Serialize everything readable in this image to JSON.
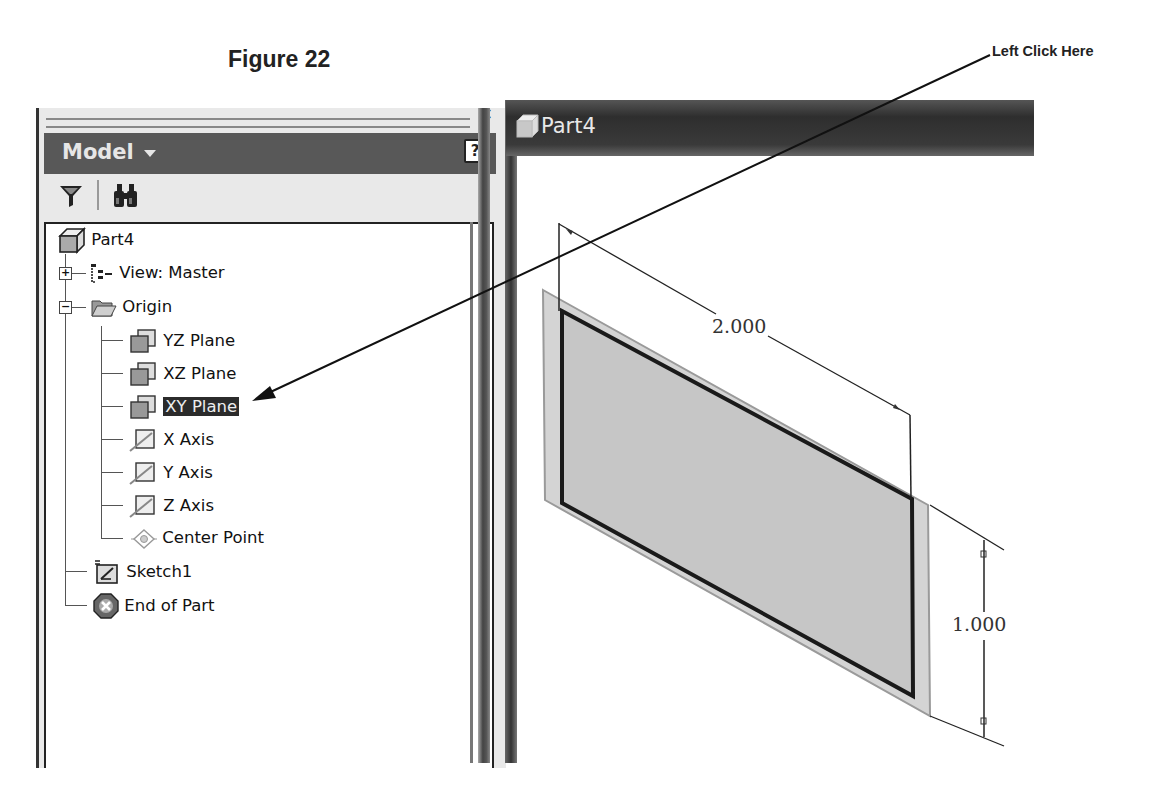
{
  "figure": {
    "title": "Figure 22"
  },
  "callout": {
    "label": "Left Click Here",
    "target": "XY Plane"
  },
  "browser_panel": {
    "close_label": "×",
    "header": {
      "title": "Model",
      "dropdown_icon": "caret-down-icon",
      "help_label": "?"
    },
    "toolbar": [
      {
        "name": "filter",
        "icon": "funnel-icon"
      },
      {
        "name": "find",
        "icon": "binoculars-icon"
      }
    ],
    "tree": [
      {
        "label": "Part4",
        "icon": "part-cube-icon",
        "level": 0
      },
      {
        "label": "View: Master",
        "icon": "view-rep-icon",
        "level": 1,
        "expander": "+"
      },
      {
        "label": "Origin",
        "icon": "folder-open-icon",
        "level": 1,
        "expander": "−"
      },
      {
        "label": "YZ Plane",
        "icon": "work-plane-icon",
        "level": 2
      },
      {
        "label": "XZ Plane",
        "icon": "work-plane-icon",
        "level": 2
      },
      {
        "label": "XY Plane",
        "icon": "work-plane-icon",
        "level": 2,
        "selected": true
      },
      {
        "label": "X Axis",
        "icon": "work-axis-icon",
        "level": 2
      },
      {
        "label": "Y Axis",
        "icon": "work-axis-icon",
        "level": 2
      },
      {
        "label": "Z Axis",
        "icon": "work-axis-icon",
        "level": 2
      },
      {
        "label": "Center Point",
        "icon": "work-point-icon",
        "level": 2
      },
      {
        "label": "Sketch1",
        "icon": "sketch-icon",
        "level": 1
      },
      {
        "label": "End of Part",
        "icon": "end-of-part-icon",
        "level": 1
      }
    ]
  },
  "graphics_window": {
    "title": "Part4",
    "title_icon": "part-cube-icon",
    "dimensions": {
      "width": "2.000",
      "height": "1.000"
    }
  }
}
